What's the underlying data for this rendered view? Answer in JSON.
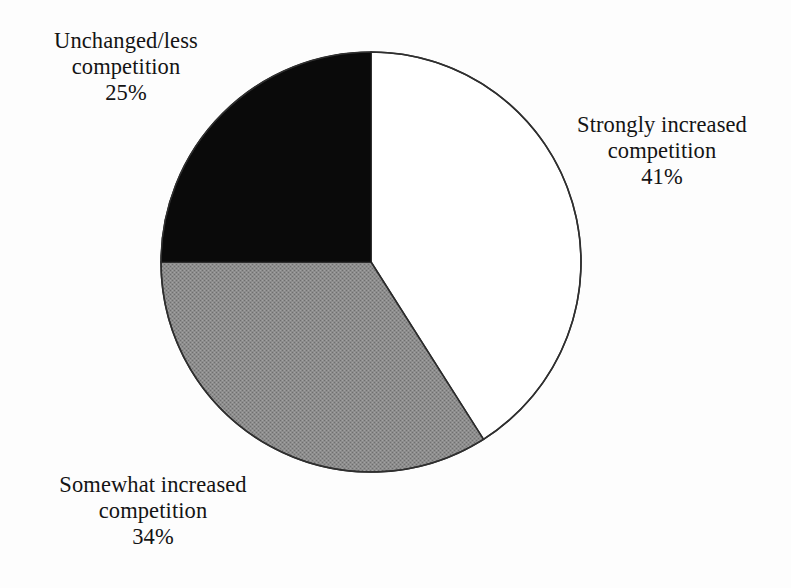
{
  "chart_data": {
    "type": "pie",
    "title": "",
    "categories": [
      "Strongly increased competition",
      "Somewhat increased competition",
      "Unchanged/less competition"
    ],
    "values": [
      41,
      34,
      25
    ],
    "value_labels": [
      "41%",
      "34%",
      "25%"
    ],
    "units": "percent",
    "start_angle_deg": 0,
    "direction": "clockwise",
    "legend": "none",
    "grid": false,
    "slice_colors": [
      "#ffffff",
      "#898989",
      "#0a0a0a"
    ],
    "slice_outline_color": "#2b2b2b",
    "background_color": "#fdfdfd"
  },
  "labels": {
    "unchanged": {
      "line1": "Unchanged/less",
      "line2": "competition",
      "percent": "25%"
    },
    "strongly": {
      "line1": "Strongly increased",
      "line2": "competition",
      "percent": "41%"
    },
    "somewhat": {
      "line1": "Somewhat increased",
      "line2": "competition",
      "percent": "34%"
    }
  }
}
